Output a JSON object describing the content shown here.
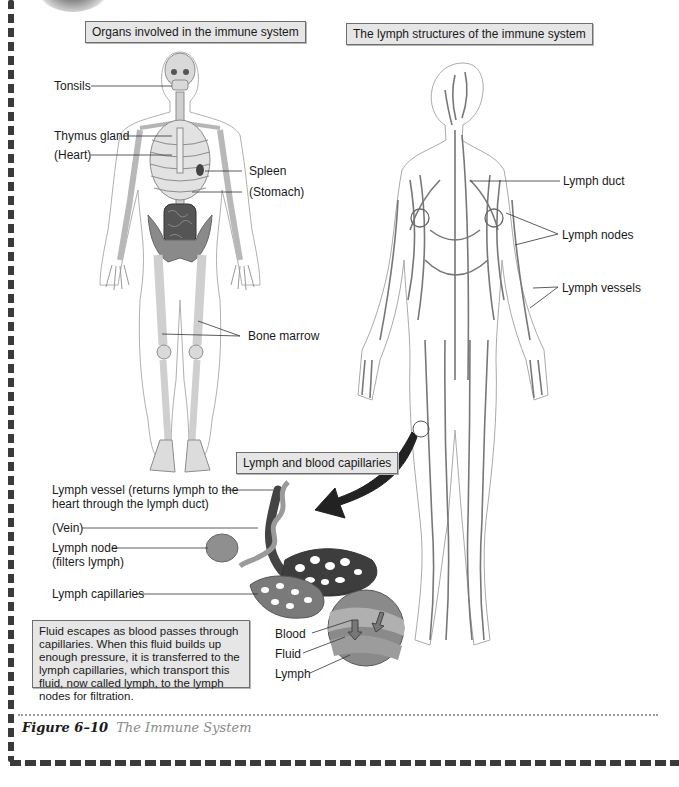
{
  "left_panel": {
    "title": "Organs involved in the immune system",
    "labels": {
      "tonsils": "Tonsils",
      "thymus": "Thymus gland",
      "heart": "(Heart)",
      "spleen": "Spleen",
      "stomach": "(Stomach)",
      "bone_marrow": "Bone marrow"
    }
  },
  "right_panel": {
    "title": "The lymph structures of the immune system",
    "labels": {
      "lymph_duct": "Lymph duct",
      "lymph_nodes": "Lymph nodes",
      "lymph_vessels": "Lymph vessels"
    }
  },
  "inset": {
    "title": "Lymph and blood capillaries",
    "labels": {
      "lymph_vessel_line1": "Lymph vessel (returns lymph to the",
      "lymph_vessel_line2": "heart through the lymph duct)",
      "vein": "(Vein)",
      "lymph_node_line1": "Lymph node",
      "lymph_node_line2": "(filters lymph)",
      "lymph_capillaries": "Lymph capillaries",
      "blood": "Blood",
      "fluid": "Fluid",
      "lymph": "Lymph"
    },
    "note": "Fluid escapes as blood passes through capillaries. When this fluid builds up enough pressure, it is transferred to the lymph capillaries, which transport this fluid, now called lymph, to the lymph nodes for filtration."
  },
  "caption": {
    "figure_number": "Figure 6–10",
    "figure_title": "The Immune System"
  }
}
